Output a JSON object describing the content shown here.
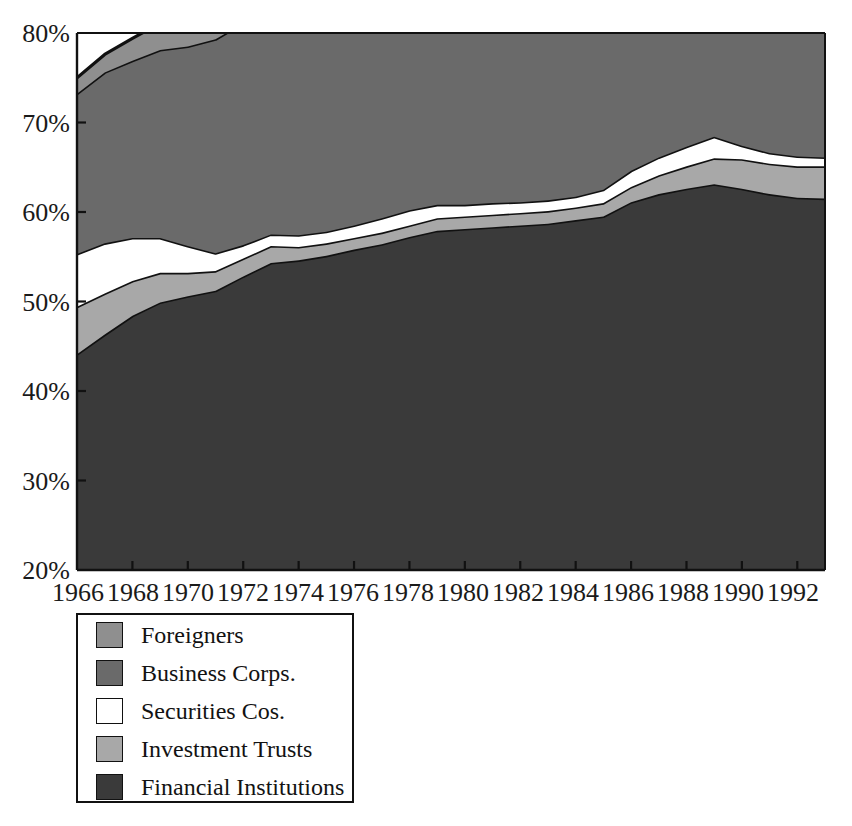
{
  "chart_data": {
    "type": "area",
    "subtype": "stacked-area",
    "title": "",
    "subtitle": "",
    "xlabel": "",
    "ylabel": "",
    "grid": false,
    "legend_position": "below-left",
    "xlim": [
      1966,
      1993
    ],
    "ylim": [
      20,
      80
    ],
    "y_tick_labels": [
      "20%",
      "30%",
      "40%",
      "50%",
      "60%",
      "70%",
      "80%"
    ],
    "y_ticks": [
      20,
      30,
      40,
      50,
      60,
      70,
      80
    ],
    "x_tick_labels": [
      "1966",
      "1968",
      "1970",
      "1972",
      "1974",
      "1976",
      "1978",
      "1980",
      "1982",
      "1984",
      "1986",
      "1988",
      "1990",
      "1992"
    ],
    "x_ticks": [
      1966,
      1968,
      1970,
      1972,
      1974,
      1976,
      1978,
      1980,
      1982,
      1984,
      1986,
      1988,
      1990,
      1992
    ],
    "x": [
      1966,
      1967,
      1968,
      1969,
      1970,
      1971,
      1972,
      1973,
      1974,
      1975,
      1976,
      1977,
      1978,
      1979,
      1980,
      1981,
      1982,
      1983,
      1984,
      1985,
      1986,
      1987,
      1988,
      1989,
      1990,
      1991,
      1992,
      1993
    ],
    "stack_order_bottom_to_top": [
      "Financial Institutions",
      "Investment Trusts",
      "Securities Cos.",
      "Business Corps.",
      "Foreigners"
    ],
    "series": [
      {
        "name": "Financial Institutions",
        "color": "#3a3a3a",
        "values": [
          24.1,
          26.3,
          28.4,
          29.9,
          30.6,
          31.2,
          32.8,
          34.3,
          34.6,
          35.1,
          35.8,
          36.4,
          37.2,
          37.9,
          38.1,
          38.3,
          38.5,
          38.7,
          39.1,
          39.5,
          41.1,
          42.0,
          42.6,
          43.1,
          42.6,
          42.0,
          41.6,
          41.5
        ]
      },
      {
        "name": "Investment Trusts",
        "color": "#a8a8a8",
        "values": [
          5.3,
          4.6,
          3.9,
          3.3,
          2.6,
          2.2,
          2.0,
          1.9,
          1.5,
          1.4,
          1.3,
          1.3,
          1.3,
          1.4,
          1.4,
          1.4,
          1.4,
          1.4,
          1.4,
          1.5,
          1.7,
          2.1,
          2.5,
          2.9,
          3.3,
          3.4,
          3.5,
          3.6
        ]
      },
      {
        "name": "Securities Cos.",
        "color": "#ffffff",
        "values": [
          5.9,
          5.6,
          4.8,
          3.9,
          3.0,
          2.0,
          1.5,
          1.3,
          1.3,
          1.3,
          1.4,
          1.6,
          1.7,
          1.5,
          1.3,
          1.3,
          1.2,
          1.2,
          1.2,
          1.5,
          1.8,
          2.0,
          2.2,
          2.4,
          1.5,
          1.2,
          1.1,
          1.0
        ]
      },
      {
        "name": "Business Corps.",
        "color": "#6a6a6a",
        "values": [
          17.9,
          19.1,
          19.8,
          21.0,
          22.3,
          23.9,
          24.8,
          26.4,
          26.6,
          26.3,
          25.9,
          26.2,
          26.5,
          26.4,
          26.1,
          26.2,
          26.4,
          26.5,
          26.6,
          26.9,
          26.9,
          26.9,
          26.7,
          25.2,
          24.8,
          24.5,
          24.1,
          24.0
        ]
      },
      {
        "name": "Foreigners",
        "color": "#8f8f8f",
        "values": [
          1.8,
          2.0,
          2.5,
          3.0,
          2.6,
          2.6,
          3.0,
          3.8,
          3.3,
          3.2,
          3.1,
          3.0,
          2.9,
          3.1,
          3.3,
          3.7,
          4.3,
          5.2,
          5.5,
          5.6,
          5.0,
          4.2,
          3.7,
          4.1,
          4.4,
          5.3,
          5.5,
          5.9
        ]
      }
    ],
    "totals": [
      55.0,
      57.6,
      59.4,
      61.1,
      61.1,
      61.9,
      64.1,
      67.7,
      67.3,
      67.3,
      67.5,
      68.5,
      69.6,
      70.3,
      70.2,
      70.9,
      71.8,
      73.0,
      73.8,
      75.0,
      76.5,
      77.2,
      77.7,
      77.7,
      76.6,
      76.4,
      75.8,
      76.0
    ]
  },
  "legend": {
    "items": [
      {
        "label": "Foreigners",
        "color": "#8f8f8f"
      },
      {
        "label": "Business Corps.",
        "color": "#6a6a6a"
      },
      {
        "label": "Securities Cos.",
        "color": "#ffffff"
      },
      {
        "label": "Investment Trusts",
        "color": "#a8a8a8"
      },
      {
        "label": "Financial Institutions",
        "color": "#3a3a3a"
      }
    ]
  },
  "colors": {
    "axis": "#111111",
    "background": "#ffffff",
    "outline": "#111111"
  }
}
